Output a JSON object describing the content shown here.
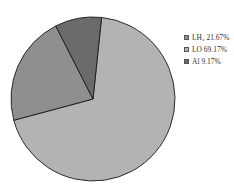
{
  "chart_data": {
    "type": "pie",
    "title": "",
    "slices": [
      {
        "label": "LH2",
        "label_display": "LH₂",
        "value": 21.67,
        "color": "#8f8f8f"
      },
      {
        "label": "LO",
        "label_display": "LO",
        "value": 69.17,
        "color": "#b3b3b3"
      },
      {
        "label": "Al",
        "label_display": "Al",
        "value": 9.17,
        "color": "#6b6b6b"
      }
    ],
    "legend_position": "right",
    "legend": [
      "LH₂ 21.67%",
      "LO 69.17%",
      "Al 9.17%"
    ]
  },
  "legend": {
    "items": [
      {
        "text": "LH₂ 21.67%",
        "color": "#8f8f8f"
      },
      {
        "text": "LO 69.17%",
        "color": "#b3b3b3"
      },
      {
        "text": "Al 9.17%",
        "color": "#6b6b6b"
      }
    ]
  }
}
